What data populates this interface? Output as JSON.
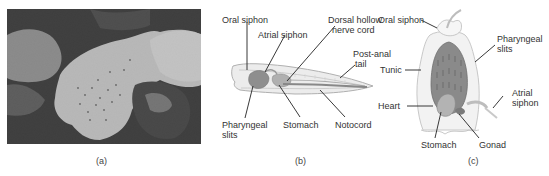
{
  "panels": [
    {
      "id": "a",
      "caption": "(a)",
      "content": "Photograph of tunicate colony (grayscale)"
    },
    {
      "id": "b",
      "caption": "(b)",
      "content": "Lancelet anatomy diagram",
      "labels": {
        "oral_siphon": "Oral siphon",
        "atrial_siphon": "Atrial siphon",
        "dorsal_line1": "Dorsal hollow",
        "dorsal_line2": "nerve cord",
        "tail_line1": "Post-anal",
        "tail_line2": "tail",
        "pharyngeal_line1": "Pharyngeal",
        "pharyngeal_line2": "slits",
        "stomach": "Stomach",
        "notocord": "Notocord"
      }
    },
    {
      "id": "c",
      "caption": "(c)",
      "content": "Adult tunicate anatomy diagram",
      "labels": {
        "oral_siphon": "Oral siphon",
        "pharyngeal_line1": "Pharyngeal",
        "pharyngeal_line2": "slits",
        "tunic": "Tunic",
        "atrial_line1": "Atrial",
        "atrial_line2": "siphon",
        "heart": "Heart",
        "stomach": "Stomach",
        "gonad": "Gonad"
      }
    }
  ],
  "colors": {
    "body_outline": "#b8b8b8",
    "body_fill": "#e8e8e8",
    "organ_fill": "#9a9a9a",
    "dark_organ": "#7a7a7a",
    "leader_line": "#222222"
  }
}
